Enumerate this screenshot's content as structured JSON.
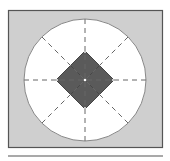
{
  "diagram": {
    "type": "geometric-figure",
    "colors": {
      "frame_fill": "#cfcfcf",
      "frame_stroke": "#555555",
      "circle_fill": "#ffffff",
      "circle_stroke": "#888888",
      "diamond_fill": "#5a5a5a",
      "dash_stroke": "#666666",
      "divider": "#555555"
    },
    "elements": {
      "frame": {
        "x": 8,
        "y": 10,
        "w": 154,
        "h": 137
      },
      "circle": {
        "cx": 85,
        "cy": 80,
        "r": 61
      },
      "diamond": {
        "cx": 85,
        "cy": 80,
        "half": 29
      },
      "radial_lines": 8,
      "divider_y": 156
    }
  }
}
